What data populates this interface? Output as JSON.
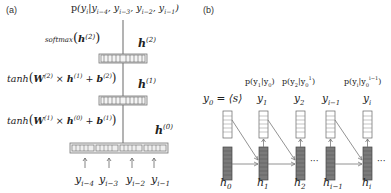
{
  "panel_a": {
    "label": "(a)",
    "title": "Feed-forward neural n-gram language model",
    "output_prob": "p(y_i | y_{i-4}, y_{i-3}, y_{i-2}, y_{i-1})",
    "layers": [
      {
        "name": "h(2)",
        "label": "h",
        "sup": "(2)",
        "op": "softmax(h^(2))"
      },
      {
        "name": "h(1)",
        "label": "h",
        "sup": "(1)",
        "op": "tanh(W^(2) × h^(1) + b^(2))"
      },
      {
        "name": "h(0)",
        "label": "h",
        "sup": "(0)",
        "op": "tanh(W^(1) × h^(0) + b^(1))"
      }
    ],
    "inputs": [
      {
        "base": "y",
        "sub": "i−4"
      },
      {
        "base": "y",
        "sub": "i−3"
      },
      {
        "base": "y",
        "sub": "i−2"
      },
      {
        "base": "y",
        "sub": "i−1"
      }
    ],
    "text": {
      "p": "p",
      "softmax": "softmax",
      "tanh": "tanh",
      "W": "W",
      "h": "h",
      "b": "b",
      "times": " × ",
      "plus": " + ",
      "sup2": "(2)",
      "sup1": "(1)",
      "sup0": "(0)"
    }
  },
  "panel_b": {
    "label": "(b)",
    "title": "Recurrent neural language model",
    "start_token": {
      "lhs_base": "y",
      "lhs_sub": "0",
      "eq": " = ",
      "rhs": "⟨s⟩"
    },
    "probs": [
      {
        "text_pre": "p(y",
        "sub": "1",
        "mid": "|y",
        "sub2": "0",
        "sup2": "",
        "post": ")"
      },
      {
        "text_pre": "p(y",
        "sub": "2",
        "mid": "|y",
        "sub2": "0",
        "sup2": "1",
        "post": ")"
      },
      {
        "text_pre": "p(y",
        "sub": "i",
        "mid": "|y",
        "sub2": "0",
        "sup2": "i−1",
        "post": ")"
      }
    ],
    "outputs": [
      {
        "base": "y",
        "sub": "1"
      },
      {
        "base": "y",
        "sub": "2"
      },
      {
        "base": "y",
        "sub": "i−1"
      },
      {
        "base": "y",
        "sub": "i"
      }
    ],
    "hidden": [
      {
        "base": "h",
        "sub": "0"
      },
      {
        "base": "h",
        "sub": "1"
      },
      {
        "base": "h",
        "sub": "2"
      },
      {
        "base": "h",
        "sub": "i−1"
      },
      {
        "base": "h",
        "sub": "i"
      }
    ],
    "ellipsis": "···"
  },
  "colors": {
    "line": "#8a8a8a",
    "box_stroke": "#555555",
    "hidden_fill": "#777777",
    "layer_bg": "#e8e8e8"
  }
}
